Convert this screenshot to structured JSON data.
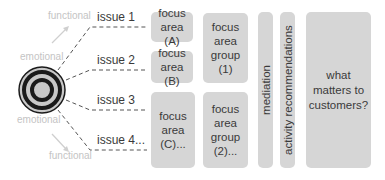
{
  "diagram": {
    "type": "flow",
    "target": {
      "icon": "target-icon"
    },
    "side_labels": {
      "top_functional": "functional",
      "top_emotional": "emotional",
      "bottom_emotional": "emotional",
      "bottom_functional": "functional"
    },
    "issues": [
      {
        "label": "issue 1"
      },
      {
        "label": "issue 2"
      },
      {
        "label": "issue 3"
      },
      {
        "label": "issue 4..."
      }
    ],
    "focus_areas": [
      {
        "label": "focus area (A)"
      },
      {
        "label": "focus area (B)"
      },
      {
        "label": "focus area (C)..."
      }
    ],
    "focus_area_groups": [
      {
        "label": "focus area group (1)"
      },
      {
        "label": "focus area group (2)..."
      }
    ],
    "mediation": {
      "label": "mediation"
    },
    "activity_recommendations": {
      "label": "activity recommendations"
    },
    "outcome": {
      "label": "what matters to customers?"
    },
    "colors": {
      "box_fill": "#d6d6d6",
      "text": "#3a3a3a",
      "light_label": "#c4c4c4",
      "target_dark": "#1a1a1a",
      "target_light": "#c8c8c8"
    }
  }
}
